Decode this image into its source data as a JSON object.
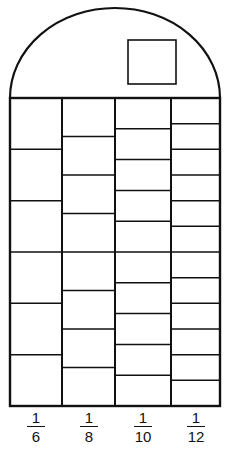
{
  "diagram": {
    "title": "",
    "stroke_color": "#111111",
    "background": "#ffffff",
    "dome": {
      "left": 10,
      "right": 220,
      "base_y": 98,
      "top_y": 8
    },
    "window": {
      "x": 128,
      "y": 40,
      "width": 48,
      "height": 44
    },
    "grid": {
      "top": 98,
      "bottom": 406
    },
    "columns": [
      {
        "label_num": "1",
        "label_den": "6",
        "x0": 10,
        "x1": 62,
        "parts": 6
      },
      {
        "label_num": "1",
        "label_den": "8",
        "x0": 62,
        "x1": 115,
        "parts": 8
      },
      {
        "label_num": "1",
        "label_den": "10",
        "x0": 115,
        "x1": 171,
        "parts": 10
      },
      {
        "label_num": "1",
        "label_den": "12",
        "x0": 171,
        "x1": 220,
        "parts": 12
      }
    ]
  }
}
